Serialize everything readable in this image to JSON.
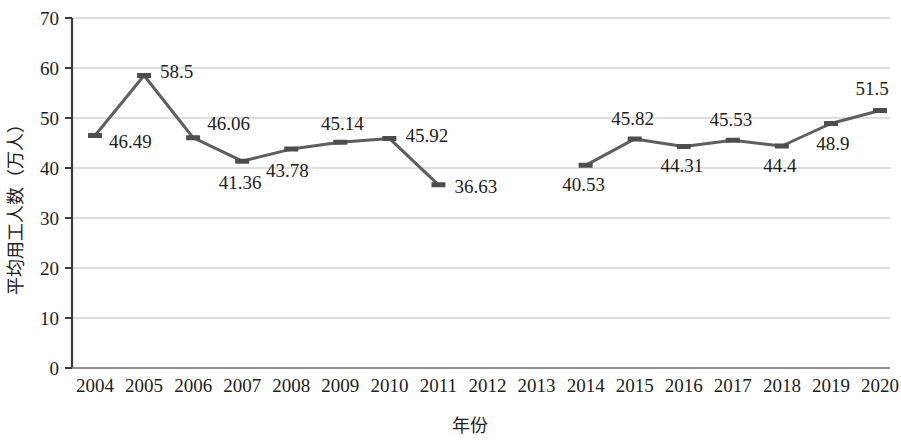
{
  "chart_data": {
    "type": "line",
    "title": "",
    "xlabel": "年份",
    "ylabel": "平均用工人数（万人）",
    "categories": [
      "2004",
      "2005",
      "2006",
      "2007",
      "2008",
      "2009",
      "2010",
      "2011",
      "2012",
      "2013",
      "2014",
      "2015",
      "2016",
      "2017",
      "2018",
      "2019",
      "2020"
    ],
    "values": [
      46.49,
      58.5,
      46.06,
      41.36,
      43.78,
      45.14,
      45.92,
      36.63,
      null,
      null,
      40.53,
      45.82,
      44.31,
      45.53,
      44.4,
      48.9,
      51.5
    ],
    "value_labels": [
      "46.49",
      "58.5",
      "46.06",
      "41.36",
      "43.78",
      "45.14",
      "45.92",
      "36.63",
      "",
      "",
      "40.53",
      "45.82",
      "44.31",
      "45.53",
      "44.4",
      "48.9",
      "51.5"
    ],
    "ylim": [
      0,
      70
    ],
    "yticks": [
      0,
      10,
      20,
      30,
      40,
      50,
      60,
      70
    ],
    "ytick_labels": [
      "0",
      "10",
      "20",
      "30",
      "40",
      "50",
      "60",
      "70"
    ],
    "grid": true,
    "grid_axis": "y",
    "legend": false,
    "legend_position": "none",
    "series": [
      {
        "name": "平均用工人数",
        "color": "#5f5f5f",
        "marker": "dash",
        "values": [
          46.49,
          58.5,
          46.06,
          41.36,
          43.78,
          45.14,
          45.92,
          36.63,
          null,
          null,
          40.53,
          45.82,
          44.31,
          45.53,
          44.4,
          48.9,
          51.5
        ]
      }
    ]
  },
  "colors": {
    "line": "#5f5f5f",
    "marker": "#4d4d4d",
    "gridline": "#bfbfbf",
    "axis": "#3a3a3a",
    "text": "#1d1d1d",
    "background": "#ffffff"
  }
}
